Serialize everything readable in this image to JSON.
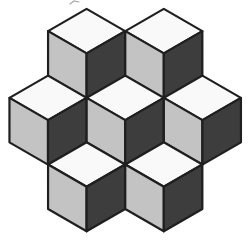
{
  "window": {
    "width": 249,
    "height": 240,
    "background": "#ffffff"
  },
  "figure": {
    "name": "isometric-cubes",
    "cube_count": 7,
    "rows": [
      2,
      3,
      2
    ],
    "cube_radius": 44.5,
    "cube_centers": [
      {
        "id": "top-left",
        "x": 86.6,
        "y": 53.4
      },
      {
        "id": "top-right",
        "x": 163.8,
        "y": 53.4
      },
      {
        "id": "middle-left",
        "x": 48.0,
        "y": 120.1
      },
      {
        "id": "middle-center",
        "x": 125.2,
        "y": 120.1
      },
      {
        "id": "middle-right",
        "x": 202.4,
        "y": 120.1
      },
      {
        "id": "bottom-left",
        "x": 86.6,
        "y": 186.8
      },
      {
        "id": "bottom-right",
        "x": 163.8,
        "y": 186.8
      }
    ],
    "colors": {
      "background": "#ffffff",
      "top_face": "#f9f9f9",
      "left_face": "#c3c3c3",
      "right_face": "#3d3d3d",
      "outline": "#1f1f1f"
    },
    "outline_width": 2.2,
    "stray_mark": {
      "points": "70,4 74,1 79,2",
      "color": "#a8a8a8",
      "width": 1.2
    }
  }
}
